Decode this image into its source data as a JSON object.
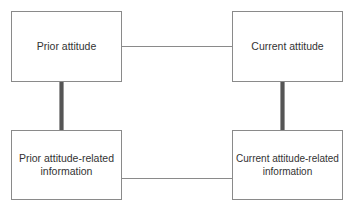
{
  "diagram": {
    "nodes": [
      {
        "id": "prior_attitude",
        "label": "Prior attitude"
      },
      {
        "id": "current_attitude",
        "label": "Current attitude"
      },
      {
        "id": "prior_info",
        "label": "Prior attitude-related information"
      },
      {
        "id": "current_info",
        "label": "Current attitude-related information"
      }
    ],
    "edges": [
      {
        "from": "prior_attitude",
        "to": "current_attitude",
        "style": "thin"
      },
      {
        "from": "prior_attitude",
        "to": "prior_info",
        "style": "thick"
      },
      {
        "from": "current_attitude",
        "to": "current_info",
        "style": "thick"
      },
      {
        "from": "prior_info",
        "to": "current_info",
        "style": "thin"
      }
    ]
  }
}
